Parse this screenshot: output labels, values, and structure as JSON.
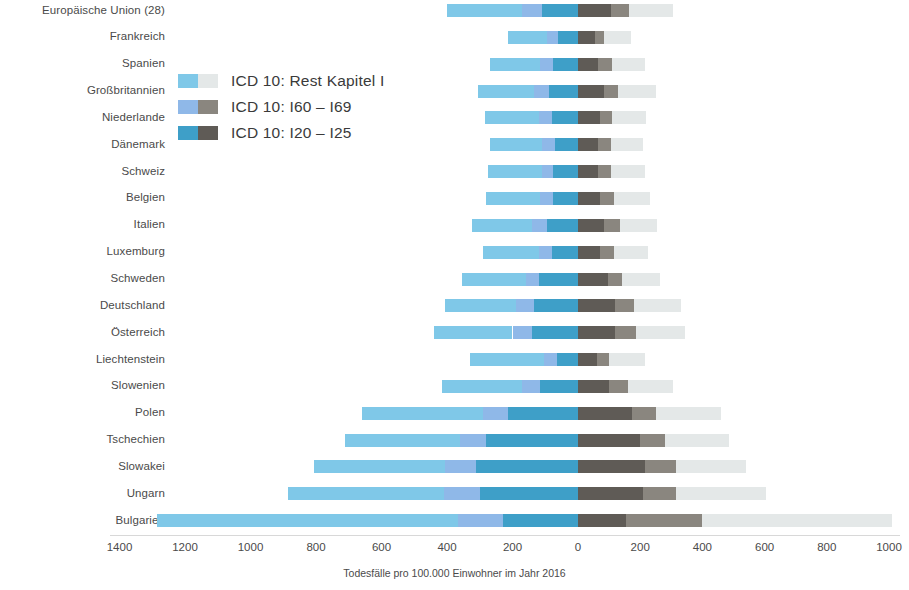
{
  "chart_data": {
    "type": "bar",
    "orientation": "horizontal-diverging",
    "title": "",
    "xlabel": "Todesfälle pro 100.000 Einwohner im Jahr 2016",
    "ylabel": "",
    "grid": false,
    "legend_position": "upper-left-inside",
    "xlim": [
      -1500,
      1050
    ],
    "xticks": [
      "1400",
      "1200",
      "1000",
      "800",
      "600",
      "400",
      "200",
      "0",
      "200",
      "400",
      "600",
      "800",
      "1000"
    ],
    "xtick_values": [
      -1400,
      -1200,
      -1000,
      -800,
      -600,
      -400,
      -200,
      0,
      200,
      400,
      600,
      800,
      1000
    ],
    "categories": [
      "Europäische Union (28)",
      "Frankreich",
      "Spanien",
      "Großbritannien",
      "Niederlande",
      "Dänemark",
      "Schweiz",
      "Belgien",
      "Italien",
      "Luxemburg",
      "Schweden",
      "Deutschland",
      "Österreich",
      "Liechtenstein",
      "Slowenien",
      "Polen",
      "Tschechien",
      "Slowakei",
      "Ungarn",
      "Bulgarien"
    ],
    "series": [
      {
        "name": "ICD 10: I20 – I25",
        "side": "left",
        "color": "#3e9fc8",
        "values": [
          110,
          60,
          75,
          90,
          80,
          70,
          75,
          75,
          95,
          80,
          120,
          135,
          140,
          65,
          115,
          215,
          280,
          310,
          300,
          230
        ]
      },
      {
        "name": "ICD 10: I60 – I69",
        "side": "left",
        "color": "#8fb8e8",
        "values": [
          60,
          35,
          40,
          45,
          40,
          40,
          35,
          40,
          45,
          40,
          40,
          55,
          60,
          40,
          55,
          75,
          80,
          95,
          110,
          135
        ]
      },
      {
        "name": "ICD 10: Rest Kapitel I",
        "side": "left",
        "color": "#7fc8e8",
        "values": [
          230,
          120,
          155,
          170,
          165,
          160,
          165,
          165,
          185,
          170,
          195,
          215,
          240,
          225,
          245,
          370,
          350,
          400,
          475,
          920
        ]
      },
      {
        "name": "ICD 10: I20 – I25",
        "side": "right",
        "color": "#5f5b56",
        "values": [
          105,
          55,
          65,
          85,
          70,
          65,
          65,
          70,
          85,
          70,
          95,
          120,
          120,
          60,
          100,
          175,
          200,
          215,
          210,
          155
        ]
      },
      {
        "name": "ICD 10: I60 – I69",
        "side": "right",
        "color": "#8a867f",
        "values": [
          60,
          30,
          45,
          45,
          40,
          40,
          40,
          45,
          50,
          45,
          45,
          60,
          65,
          40,
          60,
          75,
          80,
          100,
          105,
          245
        ]
      },
      {
        "name": "ICD 10: Rest Kapitel I",
        "side": "right",
        "color": "#e4e8e8",
        "values": [
          140,
          85,
          105,
          120,
          110,
          105,
          110,
          115,
          120,
          110,
          125,
          150,
          160,
          115,
          145,
          210,
          205,
          225,
          290,
          610
        ]
      }
    ],
    "legend": [
      {
        "label": "ICD 10: Rest Kapitel I",
        "left_color": "#7fc8e8",
        "right_color": "#e4e8e8"
      },
      {
        "label": "ICD 10: I60 – I69",
        "left_color": "#8fb8e8",
        "right_color": "#8a867f"
      },
      {
        "label": "ICD 10: I20 – I25",
        "left_color": "#3e9fc8",
        "right_color": "#5f5b56"
      }
    ]
  },
  "geometry": {
    "zero_x": 578,
    "px_per_unit_left": 0.3275,
    "px_per_unit_right": 0.311,
    "row_top": 4,
    "row_step": 26.85,
    "bar_height": 13
  }
}
